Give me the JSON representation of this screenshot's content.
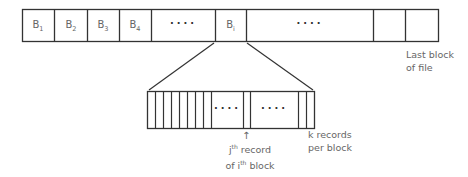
{
  "top_bar": {
    "cells": [
      {
        "label": "B",
        "sub": "1"
      },
      {
        "label": "B",
        "sub": "2"
      },
      {
        "label": "B",
        "sub": "3"
      },
      {
        "label": "B",
        "sub": "4"
      },
      {
        "label": "····",
        "sub": ""
      },
      {
        "label": "B",
        "sub": "i"
      },
      {
        "label": "····",
        "sub": ""
      },
      {
        "label": "",
        "sub": ""
      },
      {
        "label": "",
        "sub": ""
      }
    ],
    "last_block_label_line1": "Last block",
    "last_block_label_line2": "of file"
  },
  "bottom_bar": {
    "dots_left": "····",
    "dots_right": "····",
    "arrow": "↑",
    "record_label_line1_sup": "th",
    "record_label_line1_pre": "j",
    "record_label_line1_post": " record",
    "record_label_line2_pre": "of i",
    "record_label_line2_sup": "th",
    "record_label_line2_post": " block",
    "k_label_line1": "k records",
    "k_label_line2": "per block"
  },
  "colors": {
    "stroke": "#333333",
    "text": "#666666"
  }
}
